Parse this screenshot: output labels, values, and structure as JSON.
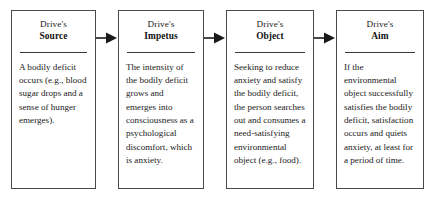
{
  "diagram": {
    "type": "flowchart",
    "orientation": "horizontal",
    "background_color": "#ffffff",
    "border_color": "#4a4a4a",
    "text_color": "#1a1a1a",
    "nodes": [
      {
        "id": "source",
        "header_line1": "Drive's",
        "header_line2": "Source",
        "body": "A bodily deficit occurs (e.g., blood sugar drops and a sense of hunger emerges)."
      },
      {
        "id": "impetus",
        "header_line1": "Drive's",
        "header_line2": "Impetus",
        "body": "The intensity of the bodily deficit grows and emerges into consciousness as a psychological discomfort, which is anxiety."
      },
      {
        "id": "object",
        "header_line1": "Drive's",
        "header_line2": "Object",
        "body": "Seeking to reduce anxiety and satisfy the bodily deficit, the person searches out and consumes a need-satisfying environmental object (e.g., food)."
      },
      {
        "id": "aim",
        "header_line1": "Drive's",
        "header_line2": "Aim",
        "body": "If the environmental object successfully satisfies the bodily deficit, satisfaction occurs and quiets anxiety, at least for a period of time."
      }
    ],
    "connectors": [
      {
        "id": "source-to-impetus",
        "from": "source",
        "to": "impetus",
        "glyph": "arrow-right"
      },
      {
        "id": "impetus-to-object",
        "from": "impetus",
        "to": "object",
        "glyph": "arrow-right"
      },
      {
        "id": "object-to-aim",
        "from": "object",
        "to": "aim",
        "glyph": "arrow-right"
      }
    ]
  }
}
